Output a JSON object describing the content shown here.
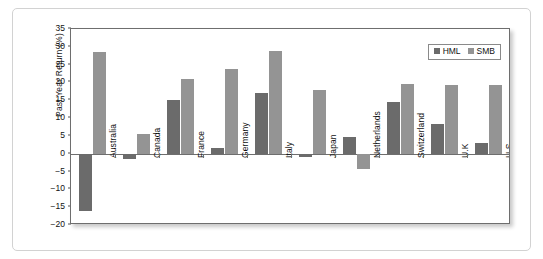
{
  "chart_data": {
    "type": "bar",
    "title": "",
    "xlabel": "",
    "ylabel": "Past Year Return (%)",
    "ylim": [
      -20,
      35
    ],
    "ytick_step": 5,
    "yticks": [
      35,
      30,
      25,
      20,
      15,
      10,
      5,
      0,
      -5,
      -10,
      -15,
      -20
    ],
    "ytick_labels": [
      "35",
      "30",
      "25",
      "20",
      "15",
      "10",
      "5",
      "0",
      "−5",
      "−10",
      "−15",
      "−20"
    ],
    "grid": false,
    "legend_position": "top-right",
    "categories": [
      "Australia",
      "Canada",
      "France",
      "Germany",
      "Italy",
      "Japan",
      "Netherlands",
      "Switzerland",
      "U.K",
      "U.S"
    ],
    "series": [
      {
        "name": "HML",
        "color": "#6b6b6b",
        "values": [
          -16.0,
          -1.5,
          15.0,
          1.5,
          17.0,
          -1.0,
          4.6,
          14.5,
          8.3,
          3.0
        ]
      },
      {
        "name": "SMB",
        "color": "#949494",
        "values": [
          28.6,
          5.6,
          21.0,
          23.7,
          28.9,
          17.9,
          -4.2,
          19.7,
          19.2,
          19.3
        ]
      }
    ]
  },
  "colors": {
    "hml": "#6b6b6b",
    "smb": "#949494",
    "axis": "#6e6e6e",
    "frame": "#d2d2d2",
    "text": "#111111"
  }
}
